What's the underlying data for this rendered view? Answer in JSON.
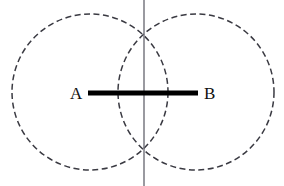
{
  "figure": {
    "width": 284,
    "height": 186,
    "background_color": "#ffffff",
    "labels": {
      "point_a": "A",
      "point_b": "B"
    },
    "colors": {
      "circle_stroke": "#3a3a42",
      "segment_stroke": "#000000",
      "vertical_line_stroke": "#6f6f78",
      "label_fill": "#111111"
    },
    "geometry": {
      "circle_left": {
        "cx": 90,
        "cy": 92,
        "r": 78,
        "style": "dashed"
      },
      "circle_right": {
        "cx": 196,
        "cy": 92,
        "r": 78,
        "style": "dashed"
      },
      "segment_ab": {
        "x1": 88,
        "y1": 93,
        "x2": 198,
        "y2": 93,
        "stroke_width": 5
      },
      "vertical_line": {
        "x1": 144,
        "y1": 0,
        "x2": 144,
        "y2": 186,
        "stroke_width": 1.4
      },
      "intersection_top": {
        "x": 144,
        "y": 38
      },
      "intersection_bottom": {
        "x": 144,
        "y": 147
      },
      "label_a_pos": {
        "x": 70,
        "y": 99
      },
      "label_b_pos": {
        "x": 204,
        "y": 99
      },
      "dash_pattern": "6 3.5"
    }
  }
}
